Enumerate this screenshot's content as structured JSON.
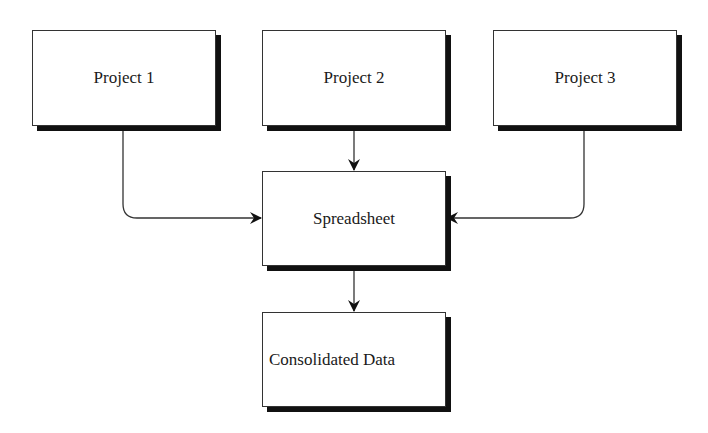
{
  "diagram": {
    "nodes": [
      {
        "id": "project1",
        "label": "Project 1"
      },
      {
        "id": "project2",
        "label": "Project 2"
      },
      {
        "id": "project3",
        "label": "Project 3"
      },
      {
        "id": "spreadsheet",
        "label": "Spreadsheet"
      },
      {
        "id": "consolidated",
        "label": "Consolidated Data"
      }
    ],
    "edges": [
      {
        "from": "project1",
        "to": "spreadsheet"
      },
      {
        "from": "project2",
        "to": "spreadsheet"
      },
      {
        "from": "project3",
        "to": "spreadsheet"
      },
      {
        "from": "spreadsheet",
        "to": "consolidated"
      }
    ],
    "colors": {
      "stroke": "#333333",
      "shadow": "#111111",
      "fill": "#ffffff"
    }
  }
}
